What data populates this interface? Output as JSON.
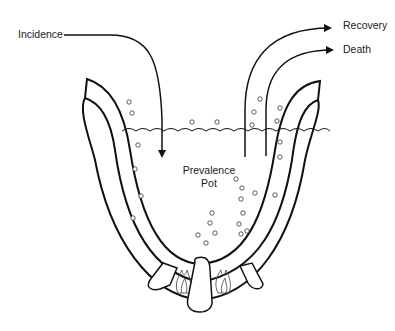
{
  "diagram": {
    "title": "Prevalence Pot",
    "labels": {
      "incidence": "Incidence",
      "recovery": "Recovery",
      "death": "Death",
      "pot_line1": "Prevalence",
      "pot_line2": "Pot"
    },
    "colors": {
      "stroke": "#111111",
      "background": "#ffffff"
    },
    "flows": [
      {
        "name": "Incidence",
        "direction": "in"
      },
      {
        "name": "Recovery",
        "direction": "out"
      },
      {
        "name": "Death",
        "direction": "out"
      }
    ]
  }
}
